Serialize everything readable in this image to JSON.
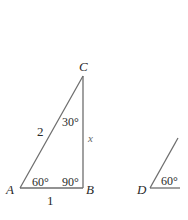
{
  "triangle_abc": {
    "vertices": {
      "a": "A",
      "b": "B",
      "c": "C"
    },
    "sides": {
      "hypotenuse_ac": "2",
      "base_ab": "1",
      "side_bc": "x"
    },
    "angles": {
      "at_a": "60°",
      "at_b": "90°",
      "at_c": "30°"
    }
  },
  "triangle_d_partial": {
    "vertices": {
      "d": "D"
    },
    "angles": {
      "at_d": "60°"
    }
  },
  "colors": {
    "line": "#6e6e6e",
    "text": "#2a2a2a"
  }
}
